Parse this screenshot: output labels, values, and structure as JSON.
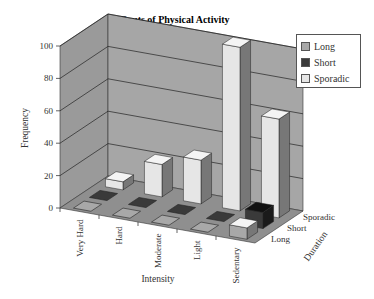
{
  "chart_data": {
    "type": "bar",
    "subtype": "3d-column",
    "title": "Bouts of Physical Activity",
    "xlabel": "Intensity",
    "ylabel": "Frequency",
    "zlabel": "Duration",
    "categories": [
      "Very Hard",
      "Hard",
      "Moderate",
      "Light",
      "Sedentary"
    ],
    "depth_categories": [
      "Long",
      "Short",
      "Sporadic"
    ],
    "series": [
      {
        "name": "Long",
        "color": "#a8a8a8",
        "values": [
          0,
          0,
          0,
          0,
          7
        ]
      },
      {
        "name": "Short",
        "color": "#3a3a3a",
        "values": [
          0,
          0,
          0,
          0,
          10
        ]
      },
      {
        "name": "Sporadic",
        "color": "#e6e6e6",
        "values": [
          5,
          20,
          27,
          101,
          61
        ]
      }
    ],
    "y_ticks": [
      "0",
      "20",
      "40",
      "60",
      "80",
      "100"
    ],
    "ylim": [
      0,
      100
    ],
    "grid": true,
    "legend_position": "right"
  },
  "legend": {
    "items": [
      {
        "label": "Long",
        "color": "#a8a8a8"
      },
      {
        "label": "Short",
        "color": "#3a3a3a"
      },
      {
        "label": "Sporadic",
        "color": "#e6e6e6"
      }
    ]
  }
}
